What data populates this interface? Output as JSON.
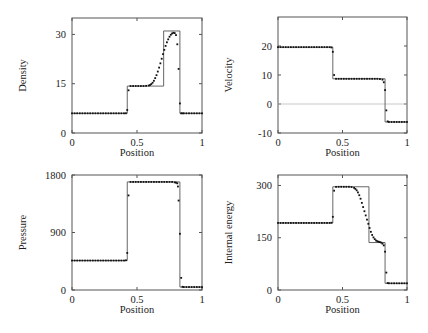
{
  "figure": {
    "x_axis_label": "Position"
  },
  "chart_data": [
    {
      "type": "line",
      "panel": "top-left",
      "title": "",
      "xlabel": "Position",
      "ylabel": "Density",
      "xlim": [
        0,
        1
      ],
      "ylim": [
        0,
        35
      ],
      "xticks": [
        0,
        0.5,
        1
      ],
      "xtick_labels": [
        "0",
        "0.5",
        "1"
      ],
      "yticks": [
        0,
        15,
        30
      ],
      "ytick_labels": [
        "0",
        "15",
        "30"
      ],
      "zero_line": false,
      "series": [
        {
          "name": "exact",
          "style": "line",
          "x": [
            0,
            0.425,
            0.425,
            0.705,
            0.705,
            0.83,
            0.83,
            1
          ],
          "y": [
            5.99,
            5.99,
            14.28,
            14.28,
            31.05,
            31.05,
            5.99,
            5.99
          ]
        },
        {
          "name": "numerical",
          "style": "points",
          "x": [
            0.0,
            0.02,
            0.04,
            0.06,
            0.08,
            0.1,
            0.12,
            0.14,
            0.16,
            0.18,
            0.2,
            0.22,
            0.24,
            0.26,
            0.28,
            0.3,
            0.32,
            0.34,
            0.36,
            0.38,
            0.4,
            0.415,
            0.425,
            0.435,
            0.45,
            0.47,
            0.49,
            0.51,
            0.53,
            0.55,
            0.57,
            0.59,
            0.6,
            0.61,
            0.62,
            0.63,
            0.64,
            0.65,
            0.66,
            0.67,
            0.68,
            0.69,
            0.7,
            0.71,
            0.72,
            0.73,
            0.74,
            0.75,
            0.76,
            0.77,
            0.78,
            0.79,
            0.8,
            0.81,
            0.82,
            0.83,
            0.84,
            0.85,
            0.86,
            0.88,
            0.9,
            0.92,
            0.94,
            0.96,
            0.98,
            1.0
          ],
          "y": [
            5.99,
            5.99,
            5.99,
            5.99,
            5.99,
            5.99,
            5.99,
            5.99,
            5.99,
            5.99,
            5.99,
            5.99,
            5.99,
            5.99,
            5.99,
            5.99,
            5.99,
            5.99,
            5.99,
            5.99,
            5.99,
            6.0,
            7.0,
            13.0,
            14.3,
            14.3,
            14.3,
            14.3,
            14.3,
            14.3,
            14.35,
            14.45,
            14.6,
            14.9,
            15.3,
            15.9,
            16.7,
            17.6,
            18.7,
            19.9,
            21.2,
            22.6,
            24.0,
            25.3,
            26.5,
            27.6,
            28.5,
            29.3,
            29.9,
            30.3,
            30.5,
            30.4,
            29.8,
            27.0,
            19.5,
            9.0,
            6.0,
            5.99,
            5.99,
            5.99,
            5.99,
            5.99,
            5.99,
            5.99,
            5.99,
            5.99
          ]
        }
      ]
    },
    {
      "type": "line",
      "panel": "top-right",
      "title": "",
      "xlabel": "Position",
      "ylabel": "Velocity",
      "xlim": [
        0,
        1
      ],
      "ylim": [
        -10,
        30
      ],
      "xticks": [
        0,
        0.5,
        1
      ],
      "xtick_labels": [
        "0",
        "0.5",
        "1"
      ],
      "yticks": [
        -10,
        0,
        10,
        20
      ],
      "ytick_labels": [
        "-10",
        "0",
        "10",
        "20"
      ],
      "zero_line": true,
      "series": [
        {
          "name": "exact",
          "style": "line",
          "x": [
            0,
            0.425,
            0.425,
            0.83,
            0.83,
            1
          ],
          "y": [
            19.6,
            19.6,
            8.69,
            8.69,
            -6.2,
            -6.2
          ]
        },
        {
          "name": "numerical",
          "style": "points",
          "x": [
            0.0,
            0.02,
            0.04,
            0.06,
            0.08,
            0.1,
            0.12,
            0.14,
            0.16,
            0.18,
            0.2,
            0.22,
            0.24,
            0.26,
            0.28,
            0.3,
            0.32,
            0.34,
            0.36,
            0.38,
            0.4,
            0.415,
            0.425,
            0.435,
            0.45,
            0.47,
            0.49,
            0.51,
            0.53,
            0.55,
            0.57,
            0.59,
            0.61,
            0.63,
            0.65,
            0.67,
            0.69,
            0.71,
            0.73,
            0.75,
            0.77,
            0.79,
            0.81,
            0.82,
            0.83,
            0.84,
            0.85,
            0.86,
            0.88,
            0.9,
            0.92,
            0.94,
            0.96,
            0.98,
            1.0
          ],
          "y": [
            19.6,
            19.6,
            19.6,
            19.6,
            19.6,
            19.6,
            19.6,
            19.6,
            19.6,
            19.6,
            19.6,
            19.6,
            19.6,
            19.6,
            19.6,
            19.6,
            19.6,
            19.6,
            19.6,
            19.6,
            19.6,
            19.5,
            18.0,
            10.0,
            8.69,
            8.69,
            8.69,
            8.69,
            8.69,
            8.69,
            8.69,
            8.69,
            8.69,
            8.69,
            8.69,
            8.69,
            8.69,
            8.69,
            8.69,
            8.69,
            8.69,
            8.6,
            8.4,
            7.5,
            4.8,
            -2.2,
            -6.0,
            -6.2,
            -6.2,
            -6.2,
            -6.2,
            -6.2,
            -6.2,
            -6.2,
            -6.2
          ]
        }
      ]
    },
    {
      "type": "line",
      "panel": "bottom-left",
      "title": "",
      "xlabel": "Position",
      "ylabel": "Pressure",
      "xlim": [
        0,
        1
      ],
      "ylim": [
        0,
        1800
      ],
      "xticks": [
        0,
        0.5,
        1
      ],
      "xtick_labels": [
        "0",
        "0.5",
        "1"
      ],
      "yticks": [
        0,
        900,
        1800
      ],
      "ytick_labels": [
        "0",
        "900",
        "1800"
      ],
      "zero_line": false,
      "series": [
        {
          "name": "exact",
          "style": "line",
          "x": [
            0,
            0.425,
            0.425,
            0.83,
            0.83,
            1
          ],
          "y": [
            460.9,
            460.9,
            1691.6,
            1691.6,
            46.1,
            46.1
          ]
        },
        {
          "name": "numerical",
          "style": "points",
          "x": [
            0.0,
            0.02,
            0.04,
            0.06,
            0.08,
            0.1,
            0.12,
            0.14,
            0.16,
            0.18,
            0.2,
            0.22,
            0.24,
            0.26,
            0.28,
            0.3,
            0.32,
            0.34,
            0.36,
            0.38,
            0.4,
            0.415,
            0.425,
            0.435,
            0.45,
            0.47,
            0.49,
            0.51,
            0.53,
            0.55,
            0.57,
            0.59,
            0.61,
            0.63,
            0.65,
            0.67,
            0.69,
            0.71,
            0.73,
            0.75,
            0.77,
            0.79,
            0.8,
            0.81,
            0.815,
            0.82,
            0.83,
            0.84,
            0.85,
            0.86,
            0.88,
            0.9,
            0.92,
            0.94,
            0.96,
            0.98,
            1.0
          ],
          "y": [
            460.9,
            460.9,
            460.9,
            460.9,
            460.9,
            460.9,
            460.9,
            460.9,
            460.9,
            460.9,
            460.9,
            460.9,
            460.9,
            460.9,
            460.9,
            460.9,
            460.9,
            460.9,
            460.9,
            460.9,
            460.9,
            465,
            580,
            1480,
            1691.6,
            1691.6,
            1691.6,
            1691.6,
            1691.6,
            1691.6,
            1691.6,
            1691.6,
            1691.6,
            1691.6,
            1691.6,
            1691.6,
            1691.6,
            1691.6,
            1691.6,
            1691.6,
            1691.6,
            1685,
            1680,
            1670,
            1620,
            1400,
            880,
            190,
            50,
            46.1,
            46.1,
            46.1,
            46.1,
            46.1,
            46.1,
            46.1,
            46.1
          ]
        }
      ]
    },
    {
      "type": "line",
      "panel": "bottom-right",
      "title": "",
      "xlabel": "Position",
      "ylabel": "Internal energy",
      "xlim": [
        0,
        1
      ],
      "ylim": [
        0,
        330
      ],
      "xticks": [
        0,
        0.5,
        1
      ],
      "xtick_labels": [
        "0",
        "0.5",
        "1"
      ],
      "yticks": [
        0,
        150,
        300
      ],
      "ytick_labels": [
        "0",
        "150",
        "300"
      ],
      "zero_line": false,
      "series": [
        {
          "name": "exact",
          "style": "line",
          "x": [
            0,
            0.425,
            0.425,
            0.705,
            0.705,
            0.83,
            0.83,
            1
          ],
          "y": [
            192.4,
            192.4,
            296.2,
            296.2,
            136.2,
            136.2,
            19.2,
            19.2
          ]
        },
        {
          "name": "numerical",
          "style": "points",
          "x": [
            0.0,
            0.02,
            0.04,
            0.06,
            0.08,
            0.1,
            0.12,
            0.14,
            0.16,
            0.18,
            0.2,
            0.22,
            0.24,
            0.26,
            0.28,
            0.3,
            0.32,
            0.34,
            0.36,
            0.38,
            0.4,
            0.415,
            0.425,
            0.435,
            0.45,
            0.47,
            0.49,
            0.51,
            0.53,
            0.55,
            0.57,
            0.59,
            0.6,
            0.61,
            0.62,
            0.63,
            0.64,
            0.65,
            0.66,
            0.67,
            0.68,
            0.69,
            0.7,
            0.71,
            0.72,
            0.73,
            0.74,
            0.75,
            0.76,
            0.77,
            0.78,
            0.79,
            0.8,
            0.81,
            0.82,
            0.83,
            0.84,
            0.85,
            0.86,
            0.88,
            0.9,
            0.92,
            0.94,
            0.96,
            0.98,
            1.0
          ],
          "y": [
            192.4,
            192.4,
            192.4,
            192.4,
            192.4,
            192.4,
            192.4,
            192.4,
            192.4,
            192.4,
            192.4,
            192.4,
            192.4,
            192.4,
            192.4,
            192.4,
            192.4,
            192.4,
            192.4,
            192.4,
            192.4,
            193,
            210,
            285,
            296,
            296.2,
            296.2,
            296.2,
            296.2,
            296.2,
            295.5,
            293,
            290,
            286,
            280,
            272,
            262,
            250,
            238,
            226,
            214,
            202,
            190,
            178,
            167,
            158,
            151,
            146,
            142,
            140,
            138.5,
            137.5,
            136,
            133,
            128,
            110,
            50,
            20,
            19.2,
            19.2,
            19.2,
            19.2,
            19.2,
            19.2,
            19.2,
            19.2
          ]
        }
      ]
    }
  ],
  "layout": {
    "panels": [
      {
        "left": 72,
        "top": 18,
        "width": 130,
        "height": 115
      },
      {
        "left": 278,
        "top": 17,
        "width": 129,
        "height": 116
      },
      {
        "left": 72,
        "top": 175,
        "width": 130,
        "height": 115
      },
      {
        "left": 278,
        "top": 175,
        "width": 129,
        "height": 115
      }
    ],
    "colors": {
      "frame": "#555555",
      "exact_line": "#555555",
      "points": "#111111",
      "zero_line": "#bbbbbb",
      "text": "#222222"
    }
  }
}
